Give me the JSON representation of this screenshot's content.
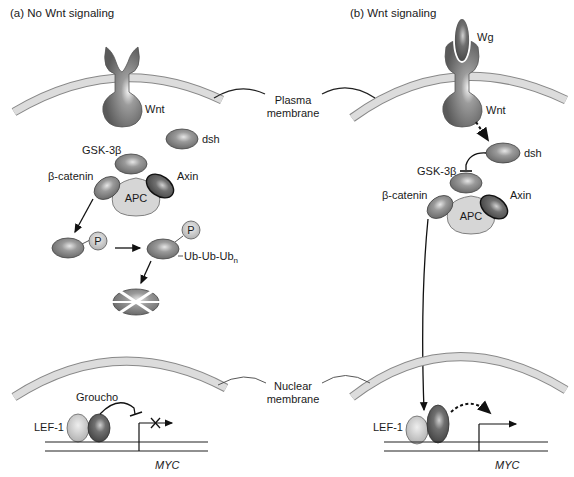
{
  "panels": {
    "a": {
      "title": "(a) No Wnt signaling",
      "labels": {
        "receptor": "Wnt",
        "dsh": "dsh",
        "gsk": "GSK-3β",
        "bcat": "β-catenin",
        "axin": "Axin",
        "apc": "APC",
        "phospho1": "P",
        "phospho2": "P",
        "ubiquitin": "Ub-Ub-Ub",
        "ubiquitin_sub": "n",
        "groucho": "Groucho",
        "lef": "LEF-1",
        "gene": "MYC"
      }
    },
    "b": {
      "title": "(b) Wnt signaling",
      "labels": {
        "ligand": "Wg",
        "receptor": "Wnt",
        "dsh": "dsh",
        "gsk": "GSK-3β",
        "bcat": "β-catenin",
        "axin": "Axin",
        "apc": "APC",
        "lef": "LEF-1",
        "gene": "MYC"
      }
    }
  },
  "center_labels": {
    "plasma_line1": "Plasma",
    "plasma_line2": "membrane",
    "nuclear_line1": "Nuclear",
    "nuclear_line2": "membrane"
  },
  "colors": {
    "membrane_fill": "#dcdcdc",
    "membrane_edge": "#8a8a8a",
    "protein_dark": "#6e6e6e",
    "protein_mid": "#8f8f8f",
    "apc_fill": "#d4d4d4",
    "text": "#1a1a1a"
  }
}
